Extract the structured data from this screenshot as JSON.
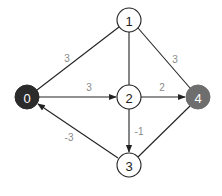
{
  "graph": {
    "type": "directed-weighted-graph",
    "nodes": [
      {
        "id": "0",
        "label": "0",
        "x": 27,
        "y": 97,
        "fill": "#2b2b2b",
        "text_color": "#ffffff"
      },
      {
        "id": "1",
        "label": "1",
        "x": 129,
        "y": 20,
        "fill": "#ffffff",
        "text_color": "#222222"
      },
      {
        "id": "2",
        "label": "2",
        "x": 129,
        "y": 97,
        "fill": "#ffffff",
        "text_color": "#222222"
      },
      {
        "id": "3",
        "label": "3",
        "x": 129,
        "y": 165,
        "fill": "#ffffff",
        "text_color": "#222222"
      },
      {
        "id": "4",
        "label": "4",
        "x": 198,
        "y": 97,
        "fill": "#6e6e6e",
        "text_color": "#ffffff"
      }
    ],
    "edges": [
      {
        "from": "1",
        "to": "0",
        "weight": "3",
        "directed": false
      },
      {
        "from": "1",
        "to": "2",
        "weight": "",
        "directed": false
      },
      {
        "from": "1",
        "to": "4",
        "weight": "3",
        "directed": false
      },
      {
        "from": "0",
        "to": "2",
        "weight": "3",
        "directed": true
      },
      {
        "from": "2",
        "to": "4",
        "weight": "2",
        "directed": true
      },
      {
        "from": "2",
        "to": "3",
        "weight": "-1",
        "directed": true
      },
      {
        "from": "3",
        "to": "0",
        "weight": "-3",
        "directed": true
      },
      {
        "from": "3",
        "to": "4",
        "weight": "",
        "directed": false
      }
    ],
    "edge_labels": {
      "e10": "3",
      "e14": "3",
      "e02": "3",
      "e24": "2",
      "e23": "-1",
      "e30": "-3"
    },
    "node_labels": {
      "n0": "0",
      "n1": "1",
      "n2": "2",
      "n3": "3",
      "n4": "4"
    }
  }
}
